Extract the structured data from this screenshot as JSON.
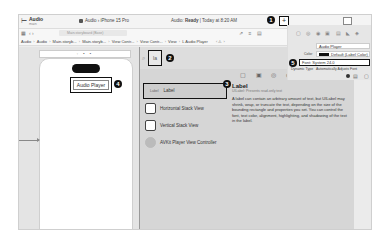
{
  "titlebar": {
    "project_name": "Audio",
    "project_subtitle": "main",
    "scheme": "Audio",
    "destination": "iPhone 15 Pro",
    "status_prefix": "Audio: ",
    "status_bold": "Ready",
    "status_suffix": " | Today at 8:20 AM",
    "add_button": "+",
    "badge_1": "1"
  },
  "navbar": {
    "search_placeholder": "Main.storyboard (Base)",
    "grid_icon": "▦",
    "back_forward": "‹ ›",
    "right_icons": "⇗ ≡ ▤"
  },
  "breadcrumb": [
    "Audio",
    "Audio",
    "Main.storyb...",
    "Main.storyb...",
    "View Contr...",
    "View Contr...",
    "View",
    "L  Audio Player"
  ],
  "breadcrumb_nav": "‹ ⚠ ›",
  "canvas": {
    "scene_bar_icons": "◦ ▪ ▪",
    "label_text": "Audio Player",
    "badge_4": "4"
  },
  "library": {
    "filter_value": "la",
    "badge_2": "2",
    "badge_3": "3",
    "tabs": "▢ ▣ ◎ ◉",
    "items": [
      {
        "tag": "Label",
        "label": "Label",
        "selected": true
      },
      {
        "label": "Horizontal Stack View"
      },
      {
        "label": "Vertical Stack View"
      },
      {
        "label": "AVKit Player View Controller"
      }
    ],
    "detail": {
      "title": "Label",
      "subtitle": "UILabel: Presents read-only text",
      "description": "A label can contain an arbitrary amount of text, but UILabel may shrink, wrap, or truncate the text, depending on the size of the bounding rectangle and properties you set. You can control the font, text color, alignment, highlighting, and shadowing of the text in the label."
    }
  },
  "inspector": {
    "tabs": "▢ ◎ ◉ ▣ ▤ ◣ ◈",
    "text_value": "Audio Player",
    "color_label": "Color",
    "color_value": "Default (Label Color)",
    "font_value": "Font: System 24.0",
    "badge_5": "5",
    "dynamic_type_label": "Dynamic Type",
    "dynamic_type_value": "Automatically Adjusts Font"
  }
}
